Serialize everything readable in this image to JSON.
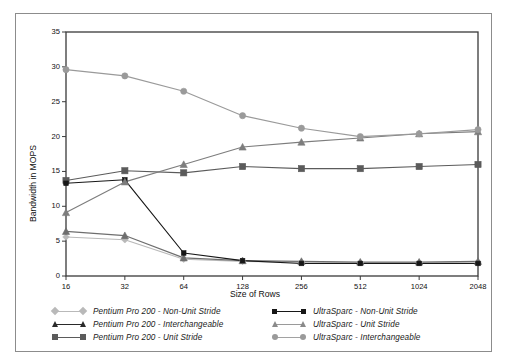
{
  "figure": {
    "background_color": "#ffffff",
    "frame_color": "#8c8c8c",
    "axis_color": "#333333"
  },
  "chart_data": {
    "type": "line",
    "title": "",
    "xlabel": "Size of Rows",
    "ylabel": "Bandwidth in MOPS",
    "categories": [
      "16",
      "32",
      "64",
      "128",
      "256",
      "512",
      "1024",
      "2048"
    ],
    "x": [
      16,
      32,
      64,
      128,
      256,
      512,
      1024,
      2048
    ],
    "xscale": "log2-categorical",
    "ylim": [
      0,
      35
    ],
    "yticks": [
      0,
      5,
      10,
      15,
      20,
      25,
      30,
      35
    ],
    "grid": false,
    "legend_position": "below-axes",
    "series": [
      {
        "name": "Pentium Pro 200 - Non-Unit Stride",
        "marker": "diamond",
        "color": "#b9b9b9",
        "values": [
          5.6,
          5.2,
          2.4,
          2.1,
          2.0,
          1.9,
          1.9,
          2.0
        ]
      },
      {
        "name": "Pentium Pro 200 - Interchangeable",
        "marker": "triangle",
        "color": "#6e6e6e",
        "values": [
          6.4,
          5.8,
          2.6,
          2.2,
          2.1,
          2.0,
          2.0,
          2.1
        ]
      },
      {
        "name": "Pentium Pro 200 - Unit Stride",
        "marker": "square",
        "color": "#5b5b5b",
        "values": [
          13.7,
          15.1,
          14.8,
          15.7,
          15.4,
          15.4,
          15.7,
          16.0
        ]
      },
      {
        "name": "UltraSparc - Non-Unit Stride",
        "marker": "square-small",
        "color": "#171717",
        "values": [
          13.3,
          13.8,
          3.3,
          2.2,
          1.8,
          1.8,
          1.8,
          1.8
        ]
      },
      {
        "name": "UltraSparc - Unit Stride",
        "marker": "triangle",
        "color": "#7d7d7d",
        "values": [
          9.1,
          13.5,
          16.0,
          18.5,
          19.2,
          19.8,
          20.4,
          20.7
        ]
      },
      {
        "name": "UltraSparc - Interchangeable",
        "marker": "circle",
        "color": "#9a9a9a",
        "values": [
          29.6,
          28.7,
          26.5,
          23.0,
          21.2,
          20.0,
          20.4,
          21.0
        ]
      }
    ]
  },
  "legend": {
    "left_column": [
      "Pentium Pro 200 - Non-Unit Stride",
      "Pentium Pro 200 - Interchangeable",
      "Pentium Pro 200 - Unit Stride"
    ],
    "right_column": [
      "UltraSparc - Non-Unit Stride",
      "UltraSparc - Unit Stride",
      "UltraSparc - Interchangeable"
    ]
  }
}
